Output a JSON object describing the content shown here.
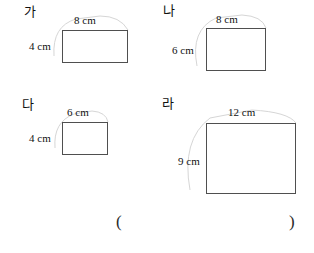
{
  "figures": [
    {
      "label": "가",
      "width_label": "8 cm",
      "height_label": "4 cm"
    },
    {
      "label": "나",
      "width_label": "8 cm",
      "height_label": "6 cm"
    },
    {
      "label": "다",
      "width_label": "6 cm",
      "height_label": "4 cm"
    },
    {
      "label": "라",
      "width_label": "12 cm",
      "height_label": "9 cm"
    }
  ],
  "answer_blank": {
    "open_paren": "(",
    "close_paren": ")"
  }
}
